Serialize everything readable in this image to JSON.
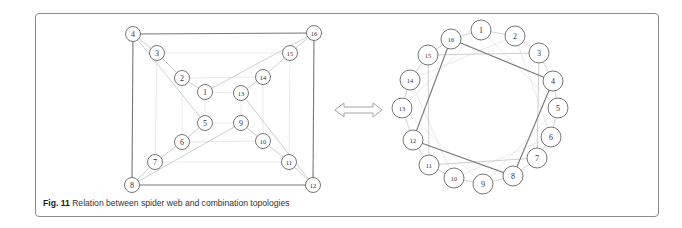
{
  "figure": {
    "label": "Fig. 11",
    "caption": "Relation between spider web and combination topologies"
  },
  "colors": {
    "frame": "#8a8a8a",
    "edge_dark": "#777777",
    "edge_light": "#c8c8c8",
    "edge_faint": "#e4e4e4",
    "node_stroke": "#666666"
  },
  "spider_web": {
    "nodes": [
      {
        "id": "1",
        "x": 205,
        "y": 92
      },
      {
        "id": "2",
        "x": 182,
        "y": 78
      },
      {
        "id": "3",
        "x": 157,
        "y": 53
      },
      {
        "id": "4",
        "x": 133,
        "y": 34
      },
      {
        "id": "5",
        "x": 205,
        "y": 123
      },
      {
        "id": "6",
        "x": 182,
        "y": 142
      },
      {
        "id": "7",
        "x": 155,
        "y": 162
      },
      {
        "id": "8",
        "x": 132,
        "y": 185
      },
      {
        "id": "9",
        "x": 241,
        "y": 123
      },
      {
        "id": "10",
        "x": 263,
        "y": 141
      },
      {
        "id": "11",
        "x": 289,
        "y": 162
      },
      {
        "id": "12",
        "x": 313,
        "y": 185
      },
      {
        "id": "13",
        "x": 241,
        "y": 93
      },
      {
        "id": "14",
        "x": 263,
        "y": 77
      },
      {
        "id": "15",
        "x": 290,
        "y": 53
      },
      {
        "id": "16",
        "x": 314,
        "y": 33
      }
    ],
    "edges_dark": [
      [
        "4",
        "16"
      ],
      [
        "16",
        "12"
      ],
      [
        "12",
        "8"
      ],
      [
        "8",
        "4"
      ]
    ],
    "edges_light": [
      [
        "4",
        "3"
      ],
      [
        "3",
        "2"
      ],
      [
        "2",
        "1"
      ],
      [
        "8",
        "7"
      ],
      [
        "7",
        "6"
      ],
      [
        "6",
        "5"
      ],
      [
        "16",
        "15"
      ],
      [
        "15",
        "14"
      ],
      [
        "14",
        "13"
      ],
      [
        "12",
        "11"
      ],
      [
        "11",
        "10"
      ],
      [
        "10",
        "9"
      ],
      [
        "4",
        "5"
      ],
      [
        "1",
        "16"
      ],
      [
        "8",
        "9"
      ],
      [
        "13",
        "12"
      ]
    ],
    "edges_faint": [
      [
        "3",
        "15"
      ],
      [
        "15",
        "11"
      ],
      [
        "11",
        "7"
      ],
      [
        "7",
        "3"
      ],
      [
        "2",
        "14"
      ],
      [
        "14",
        "10"
      ],
      [
        "10",
        "6"
      ],
      [
        "6",
        "2"
      ],
      [
        "1",
        "13"
      ],
      [
        "13",
        "9"
      ],
      [
        "9",
        "5"
      ],
      [
        "5",
        "1"
      ]
    ]
  },
  "combination": {
    "nodes": [
      {
        "id": "1",
        "x": 481,
        "y": 30
      },
      {
        "id": "2",
        "x": 515,
        "y": 36
      },
      {
        "id": "3",
        "x": 539,
        "y": 53
      },
      {
        "id": "4",
        "x": 553,
        "y": 81
      },
      {
        "id": "5",
        "x": 558,
        "y": 108
      },
      {
        "id": "6",
        "x": 551,
        "y": 137
      },
      {
        "id": "7",
        "x": 537,
        "y": 158
      },
      {
        "id": "8",
        "x": 513,
        "y": 176
      },
      {
        "id": "9",
        "x": 483,
        "y": 184
      },
      {
        "id": "10",
        "x": 454,
        "y": 178
      },
      {
        "id": "11",
        "x": 429,
        "y": 165
      },
      {
        "id": "12",
        "x": 413,
        "y": 140
      },
      {
        "id": "13",
        "x": 402,
        "y": 108
      },
      {
        "id": "14",
        "x": 410,
        "y": 80
      },
      {
        "id": "15",
        "x": 428,
        "y": 55
      },
      {
        "id": "16",
        "x": 451,
        "y": 39
      }
    ],
    "ring": [
      "1",
      "2",
      "3",
      "4",
      "5",
      "6",
      "7",
      "8",
      "9",
      "10",
      "11",
      "12",
      "13",
      "14",
      "15",
      "16"
    ],
    "edges_dark": [
      [
        "16",
        "4"
      ],
      [
        "4",
        "8"
      ],
      [
        "8",
        "12"
      ],
      [
        "12",
        "16"
      ]
    ],
    "edges_light": [
      [
        "15",
        "3"
      ],
      [
        "3",
        "7"
      ],
      [
        "7",
        "11"
      ],
      [
        "11",
        "15"
      ]
    ],
    "edges_faint": [
      [
        "2",
        "6"
      ],
      [
        "6",
        "10"
      ],
      [
        "10",
        "14"
      ],
      [
        "14",
        "2"
      ],
      [
        "1",
        "5"
      ],
      [
        "5",
        "9"
      ],
      [
        "9",
        "13"
      ],
      [
        "13",
        "1"
      ]
    ]
  },
  "equivalence_arrow": {
    "icon": "double-arrow-icon",
    "x1": 335,
    "x2": 382,
    "y": 110
  }
}
